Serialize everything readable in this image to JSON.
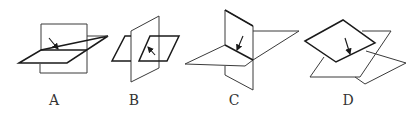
{
  "figures": [
    {
      "id": "A",
      "label": "A",
      "description": "Vertical rectangle plane pierced by horizontal parallelogram plane; arrow points to intersection line"
    },
    {
      "id": "B",
      "label": "B",
      "description": "Vertical parallelogram plane with a smaller horizontal parallelogram passing through it; arrow points to intersection"
    },
    {
      "id": "C",
      "label": "C",
      "description": "Vertical tilted plane crossing a horizontal parallelogram plane; arrow points to intersection line"
    },
    {
      "id": "D",
      "label": "D",
      "description": "Two overlapping tilted parallelogram planes; arrow points to intersection line"
    }
  ],
  "colors": {
    "stroke": "#1a1a1a",
    "label": "#333333",
    "background": "#ffffff"
  }
}
